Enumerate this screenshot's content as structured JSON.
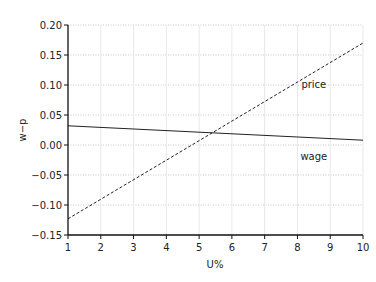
{
  "chart_data": {
    "type": "line",
    "title": "",
    "xlabel": "U%",
    "ylabel": "w−p",
    "xlim": [
      1,
      10
    ],
    "ylim": [
      -0.15,
      0.2
    ],
    "grid": true,
    "x_ticks": [
      "1",
      "2",
      "3",
      "4",
      "5",
      "6",
      "7",
      "8",
      "9",
      "10"
    ],
    "y_ticks": [
      "0.20",
      "0.15",
      "0.10",
      "0.05",
      "0.00",
      "−0.05",
      "−0.10",
      "−0.15"
    ],
    "series": [
      {
        "name": "price",
        "style": "dashed",
        "x": [
          1,
          10
        ],
        "values": [
          -0.123,
          0.17
        ],
        "label_pos": [
          8.5,
          0.095
        ]
      },
      {
        "name": "wage",
        "style": "solid",
        "x": [
          1,
          10
        ],
        "values": [
          0.032,
          0.008
        ],
        "label_pos": [
          8.5,
          -0.025
        ]
      }
    ],
    "annotations": [
      "price",
      "wage"
    ]
  }
}
